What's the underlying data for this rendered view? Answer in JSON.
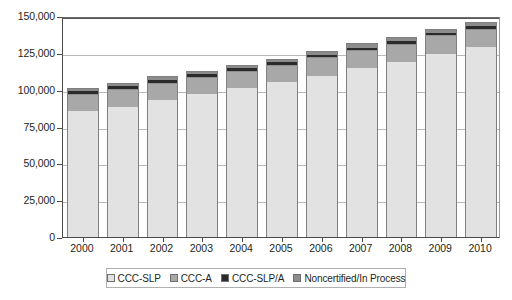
{
  "chart_data": {
    "type": "bar",
    "stacked": true,
    "title": "",
    "subtitle": "",
    "xlabel": "",
    "ylabel": "",
    "ylim": [
      0,
      150000
    ],
    "ytick_values": [
      0,
      25000,
      50000,
      75000,
      100000,
      125000,
      150000
    ],
    "ytick_labels": [
      "0",
      "25,000",
      "50,000",
      "75,000",
      "100,000",
      "125,000",
      "150,000"
    ],
    "grid": true,
    "grid_axis": "y",
    "legend_position": "bottom",
    "categories": [
      "2000",
      "2001",
      "2002",
      "2003",
      "2004",
      "2005",
      "2006",
      "2007",
      "2008",
      "2009",
      "2010"
    ],
    "series": [
      {
        "name": "CCC-SLP",
        "color": "#e2e2e2",
        "values": [
          86000,
          89000,
          93500,
          97500,
          101500,
          105500,
          110000,
          115000,
          119500,
          125000,
          129500
        ]
      },
      {
        "name": "CCC-A",
        "color": "#a8a8a8",
        "values": [
          11500,
          12000,
          12000,
          12000,
          12000,
          12000,
          12500,
          12500,
          12500,
          12500,
          12500
        ]
      },
      {
        "name": "CCC-SLP/A",
        "color": "#2b2b2b",
        "values": [
          2000,
          2000,
          2000,
          2000,
          2000,
          1800,
          1800,
          1700,
          1700,
          1600,
          1600
        ]
      },
      {
        "name": "Noncertified/In Process",
        "color": "#8c8c8c",
        "values": [
          1500,
          1500,
          1500,
          1500,
          1500,
          1700,
          2200,
          2300,
          2300,
          2400,
          2400
        ]
      }
    ],
    "totals": [
      101000,
      104500,
      109000,
      113000,
      117000,
      121000,
      126500,
      131500,
      136000,
      141500,
      146000
    ]
  },
  "legend": {
    "items": [
      {
        "label": "CCC-SLP"
      },
      {
        "label": "CCC-A"
      },
      {
        "label": "CCC-SLP/A"
      },
      {
        "label": "Noncertified/In Process"
      }
    ]
  }
}
